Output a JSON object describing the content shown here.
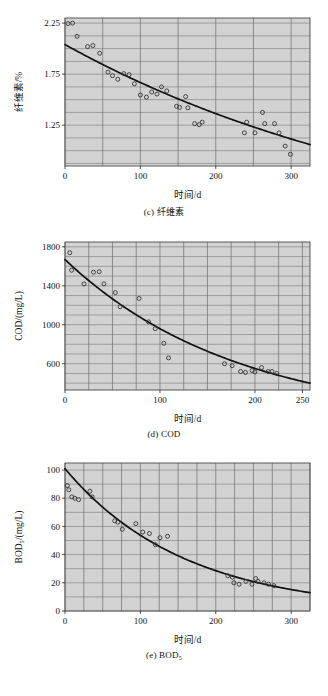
{
  "page": {
    "background": "#ffffff",
    "plot_background": "#d2d2d2",
    "grid_color": "#6e6e6e",
    "curve_color": "#111111",
    "marker_color": "#333333"
  },
  "figures": [
    {
      "id": "fig-c",
      "caption": "(c) 纤维素",
      "chart_data": {
        "type": "scatter",
        "title": "(c) 纤维素",
        "xlabel": "时间/d",
        "ylabel": "纤维素/%",
        "xlim": [
          0,
          325
        ],
        "ylim": [
          0.85,
          2.3
        ],
        "xticks": [
          0,
          100,
          200,
          300
        ],
        "xticklabels": [
          "0",
          "100",
          "200",
          "300"
        ],
        "xminor_step": 50,
        "yticks": [
          1.25,
          1.75,
          2.25
        ],
        "yticklabels": [
          "1.25",
          "1.75",
          "2.25"
        ],
        "yminor_step": 0.125,
        "grid": true,
        "legend": "none",
        "points": [
          [
            4,
            2.245
          ],
          [
            10,
            2.25
          ],
          [
            16,
            2.12
          ],
          [
            30,
            2.02
          ],
          [
            37,
            2.03
          ],
          [
            46,
            1.955
          ],
          [
            57,
            1.77
          ],
          [
            63,
            1.735
          ],
          [
            70,
            1.7
          ],
          [
            78,
            1.755
          ],
          [
            85,
            1.745
          ],
          [
            92,
            1.655
          ],
          [
            100,
            1.545
          ],
          [
            108,
            1.525
          ],
          [
            115,
            1.575
          ],
          [
            122,
            1.555
          ],
          [
            128,
            1.625
          ],
          [
            135,
            1.585
          ],
          [
            148,
            1.435
          ],
          [
            152,
            1.425
          ],
          [
            160,
            1.53
          ],
          [
            163,
            1.42
          ],
          [
            172,
            1.265
          ],
          [
            178,
            1.255
          ],
          [
            182,
            1.28
          ],
          [
            238,
            1.175
          ],
          [
            241,
            1.28
          ],
          [
            252,
            1.175
          ],
          [
            262,
            1.375
          ],
          [
            265,
            1.265
          ],
          [
            278,
            1.265
          ],
          [
            284,
            1.175
          ],
          [
            292,
            1.045
          ],
          [
            299,
            0.965
          ]
        ],
        "fit": {
          "model": "exponential_decay",
          "description": "纤维素含量随时间衰减拟合曲线",
          "y0": 2.04,
          "y_end": 1.06
        }
      }
    },
    {
      "id": "fig-d",
      "caption": "(d) COD",
      "chart_data": {
        "type": "scatter",
        "title": "(d) COD",
        "xlabel": "时间/d",
        "ylabel": "COD/(mg/L)",
        "xlim": [
          0,
          258
        ],
        "ylim": [
          330,
          1850
        ],
        "xticks": [
          0,
          100,
          200,
          250
        ],
        "xticklabels": [
          "0",
          "100",
          "200",
          "250"
        ],
        "xminor_step": 25,
        "yticks": [
          600,
          1000,
          1400,
          1800
        ],
        "yticklabels": [
          "600",
          "1000",
          "1400",
          "1800"
        ],
        "yminor_step": 100,
        "grid": true,
        "legend": "none",
        "points": [
          [
            5,
            1740
          ],
          [
            7,
            1560
          ],
          [
            20,
            1420
          ],
          [
            30,
            1540
          ],
          [
            36,
            1545
          ],
          [
            41,
            1420
          ],
          [
            53,
            1330
          ],
          [
            58,
            1185
          ],
          [
            78,
            1270
          ],
          [
            88,
            1030
          ],
          [
            95,
            960
          ],
          [
            104,
            810
          ],
          [
            109,
            660
          ],
          [
            168,
            600
          ],
          [
            176,
            580
          ],
          [
            185,
            520
          ],
          [
            190,
            510
          ],
          [
            197,
            530
          ],
          [
            200,
            515
          ],
          [
            207,
            560
          ],
          [
            214,
            520
          ],
          [
            218,
            520
          ],
          [
            223,
            500
          ]
        ],
        "fit": {
          "model": "exponential_decay",
          "description": "COD 浓度随时间衰减拟合曲线",
          "y0": 1670,
          "y_end": 400
        }
      }
    },
    {
      "id": "fig-e",
      "caption": "(e) BOD₅",
      "chart_data": {
        "type": "scatter",
        "title": "(e) BOD₅",
        "xlabel": "时间/d",
        "ylabel": "BOD₅/(mg/L)",
        "xlim": [
          0,
          325
        ],
        "ylim": [
          0,
          105
        ],
        "xticks": [
          0,
          100,
          200,
          300
        ],
        "xticklabels": [
          "0",
          "100",
          "200",
          "300"
        ],
        "xminor_step": 25,
        "yticks": [
          0,
          20,
          40,
          60,
          80,
          100
        ],
        "yticklabels": [
          "0",
          "20",
          "40",
          "60",
          "80",
          "100"
        ],
        "yminor_step": 10,
        "grid": true,
        "legend": "none",
        "points": [
          [
            3,
            89
          ],
          [
            5,
            86
          ],
          [
            9,
            81
          ],
          [
            13,
            80
          ],
          [
            18,
            79
          ],
          [
            33,
            85
          ],
          [
            36,
            81
          ],
          [
            66,
            64
          ],
          [
            70,
            63
          ],
          [
            76,
            58
          ],
          [
            94,
            62
          ],
          [
            103,
            56
          ],
          [
            112,
            55
          ],
          [
            120,
            47
          ],
          [
            126,
            52
          ],
          [
            136,
            53
          ],
          [
            216,
            25
          ],
          [
            222,
            24
          ],
          [
            224,
            20
          ],
          [
            231,
            19
          ],
          [
            240,
            21
          ],
          [
            248,
            19
          ],
          [
            253,
            23
          ],
          [
            256,
            21
          ],
          [
            264,
            20
          ],
          [
            270,
            19
          ],
          [
            277,
            18
          ]
        ],
        "fit": {
          "model": "exponential_decay",
          "description": "BOD5 浓度随时间衰减拟合曲线",
          "y0": 101,
          "y_end": 13
        }
      }
    }
  ]
}
